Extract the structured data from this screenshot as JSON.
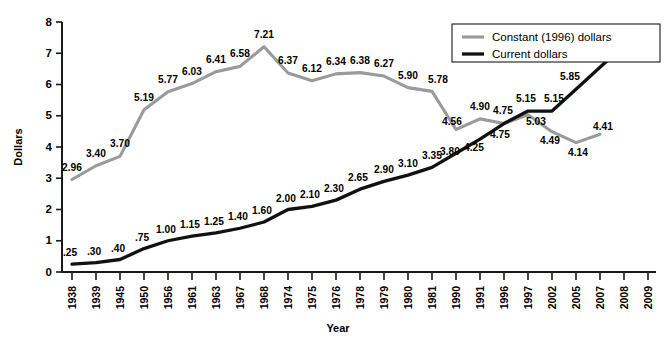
{
  "chart_data": {
    "type": "line",
    "title": "",
    "xlabel": "Year",
    "ylabel": "Dollars",
    "ylim": [
      0,
      8
    ],
    "yticks": [
      0,
      1,
      2,
      3,
      4,
      5,
      6,
      7,
      8
    ],
    "grid": false,
    "legend_position": "top-right",
    "categories": [
      "1938",
      "1939",
      "1945",
      "1950",
      "1956",
      "1961",
      "1963",
      "1967",
      "1968",
      "1974",
      "1975",
      "1976",
      "1978",
      "1979",
      "1980",
      "1981",
      "1990",
      "1991",
      "1996",
      "1997",
      "2002",
      "2005",
      "2007",
      "2008",
      "2009"
    ],
    "series": [
      {
        "name": "Constant (1996) dollars",
        "color": "#9a9a9a",
        "values": [
          2.96,
          3.4,
          3.7,
          5.19,
          5.77,
          6.03,
          6.41,
          6.58,
          7.21,
          6.37,
          6.12,
          6.34,
          6.38,
          6.27,
          5.9,
          5.78,
          4.56,
          4.9,
          4.75,
          5.03,
          4.49,
          4.14,
          4.41,
          null,
          null
        ],
        "labels": [
          "2.96",
          "3.40",
          "3.70",
          "5.19",
          "5.77",
          "6.03",
          "6.41",
          "6.58",
          "7.21",
          "6.37",
          "6.12",
          "6.34",
          "6.38",
          "6.27",
          "5.90",
          "5.78",
          "4.56",
          "4.90",
          "4.75",
          "5.03",
          "4.49",
          "4.14",
          "4.41",
          "",
          ""
        ]
      },
      {
        "name": "Current dollars",
        "color": "#111111",
        "values": [
          0.25,
          0.3,
          0.4,
          0.75,
          1.0,
          1.15,
          1.25,
          1.4,
          1.6,
          2.0,
          2.1,
          2.3,
          2.65,
          2.9,
          3.1,
          3.35,
          3.8,
          4.25,
          4.75,
          5.15,
          5.15,
          5.85,
          6.55,
          7.25,
          null
        ],
        "labels": [
          ".25",
          ".30",
          ".40",
          ".75",
          "1.00",
          "1.15",
          "1.25",
          "1.40",
          "1.60",
          "2.00",
          "2.10",
          "2.30",
          "2.65",
          "2.90",
          "3.10",
          "3.35",
          "3.80",
          "4.25",
          "4.75",
          "5.15",
          "5.15",
          "5.85",
          "6.55",
          "7.25",
          ""
        ]
      }
    ]
  },
  "legend": {
    "items": [
      {
        "label": "Constant (1996) dollars",
        "color": "#9a9a9a"
      },
      {
        "label": "Current dollars",
        "color": "#111111"
      }
    ]
  },
  "axes": {
    "y_title": "Dollars",
    "x_title": "Year"
  }
}
